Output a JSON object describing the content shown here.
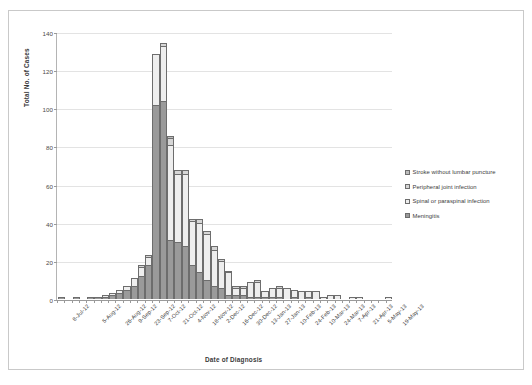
{
  "chart_data": {
    "type": "bar",
    "title": "",
    "subtitle": "",
    "xlabel": "Date of Diagnosis",
    "ylabel": "Total No. of Cases",
    "ylim": [
      0,
      140
    ],
    "yticks": [
      0,
      20,
      40,
      60,
      80,
      100,
      120,
      140
    ],
    "grid": true,
    "stacked": true,
    "legend_position": "right",
    "colors": {
      "meningitis": "#9a9a9a",
      "spinal_or_paraspinal_infection": "#eeeeee",
      "peripheral_joint_infection": "#d6d6d6",
      "stroke_without_lumbar_puncture": "#bdbdbd",
      "bar_outline": "#6d6d6d",
      "gridline": "#e3e3e3",
      "axis": "#9a9a9a",
      "frame": "#c9c9c9"
    },
    "categories": [
      "8-Jul-12",
      "15-Jul-12",
      "22-Jul-12",
      "29-Jul-12",
      "5-Aug-12",
      "12-Aug-12",
      "19-Aug-12",
      "26-Aug-12",
      "2-Sep-12",
      "9-Sep-12",
      "16-Sep-12",
      "23-Sep-12",
      "30-Sep-12",
      "7-Oct-12",
      "14-Oct-12",
      "21-Oct-12",
      "28-Oct-12",
      "4-Nov-12",
      "11-Nov-12",
      "18-Nov-12",
      "25-Nov-12",
      "2-Dec-12",
      "9-Dec-12",
      "16-Dec-12",
      "23-Dec-12",
      "30-Dec-12",
      "6-Jan-13",
      "13-Jan-13",
      "20-Jan-13",
      "27-Jan-13",
      "3-Feb-13",
      "10-Feb-13",
      "17-Feb-13",
      "24-Feb-13",
      "3-Mar-13",
      "10-Mar-13",
      "17-Mar-13",
      "24-Mar-13",
      "31-Mar-13",
      "7-Apr-13",
      "14-Apr-13",
      "21-Apr-13",
      "28-Apr-13",
      "5-May-13",
      "12-May-13",
      "19-May-13"
    ],
    "tick_labels_shown": [
      "8-Jul-12",
      "5-Aug-12",
      "26-Aug-12",
      "9-Sep-12",
      "23-Sep-12",
      "7-Oct-12",
      "21-Oct-12",
      "4-Nov-12",
      "18-Nov-12",
      "2-Dec-12",
      "16-Dec-12",
      "30-Dec-12",
      "13-Jan-13",
      "27-Jan-13",
      "10-Feb-13",
      "24-Feb-13",
      "10-Mar-13",
      "24-Mar-13",
      "7-Apr-13",
      "21-Apr-13",
      "5-May-13",
      "19-May-13"
    ],
    "series": [
      {
        "name": "Meningitis",
        "key": "meningitis",
        "color": "#9a9a9a",
        "values": [
          1,
          0,
          1,
          0,
          1,
          1,
          1,
          2,
          3,
          5,
          7,
          12,
          18,
          102,
          104,
          31,
          30,
          28,
          18,
          14,
          10,
          7,
          6,
          2,
          2,
          2,
          1,
          1,
          1,
          1,
          1,
          0,
          1,
          0,
          1,
          0,
          0,
          0,
          0,
          0,
          0,
          0,
          0,
          0,
          0,
          0
        ]
      },
      {
        "name": "Spinal or paraspinal infection",
        "key": "spinal_or_paraspinal_infection",
        "color": "#eeeeee",
        "values": [
          0,
          0,
          0,
          0,
          0,
          0,
          1,
          1,
          2,
          2,
          4,
          5,
          4,
          27,
          29,
          50,
          36,
          38,
          23,
          26,
          24,
          19,
          14,
          12,
          4,
          4,
          8,
          8,
          3,
          5,
          5,
          6,
          4,
          4,
          3,
          4,
          1,
          2,
          2,
          0,
          1,
          1,
          0,
          0,
          0,
          1
        ]
      },
      {
        "name": "Peripheral joint infection",
        "key": "peripheral_joint_infection",
        "color": "#d6d6d6",
        "values": [
          0,
          0,
          0,
          0,
          0,
          0,
          0,
          0,
          0,
          0,
          0,
          1,
          1,
          0,
          2,
          4,
          2,
          2,
          1,
          2,
          2,
          2,
          1,
          1,
          1,
          1,
          0,
          1,
          0,
          0,
          1,
          0,
          0,
          0,
          0,
          0,
          0,
          0,
          0,
          0,
          0,
          0,
          0,
          0,
          0,
          0
        ]
      },
      {
        "name": "Stroke without lumbar puncture",
        "key": "stroke_without_lumbar_puncture",
        "color": "#bdbdbd",
        "values": [
          0,
          0,
          0,
          0,
          0,
          0,
          0,
          0,
          0,
          0,
          0,
          0,
          0,
          0,
          0,
          1,
          0,
          0,
          0,
          0,
          0,
          0,
          0,
          0,
          0,
          0,
          0,
          0,
          0,
          0,
          0,
          0,
          0,
          0,
          0,
          0,
          0,
          0,
          0,
          0,
          0,
          0,
          0,
          0,
          0,
          0
        ]
      }
    ]
  },
  "legend": {
    "items": [
      {
        "label": "Stroke without lumbar puncture",
        "key": "stroke_without_lumbar_puncture"
      },
      {
        "label": "Peripheral joint infection",
        "key": "peripheral_joint_infection"
      },
      {
        "label": "Spinal or paraspinal infection",
        "key": "spinal_or_paraspinal_infection"
      },
      {
        "label": "Meningitis",
        "key": "meningitis"
      }
    ]
  }
}
